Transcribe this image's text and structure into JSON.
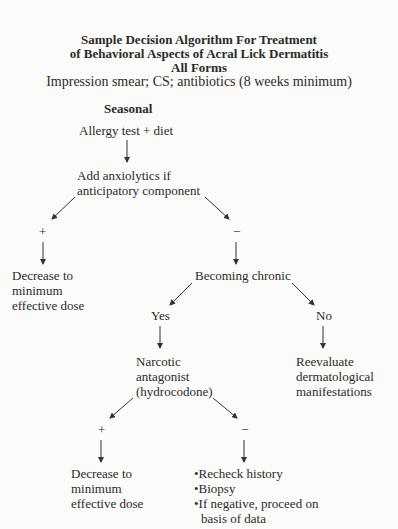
{
  "title": {
    "line1": "Sample Decision Algorithm For Treatment",
    "line2": "of Behavioral Aspects of Acral Lick Dermatitis",
    "line3": "All Forms",
    "subtitle": "Impression smear; CS; antibiotics (8 weeks minimum)"
  },
  "nodes": {
    "seasonal": "Seasonal",
    "allergy": "Allergy test + diet",
    "anxio1": "Add anxiolytics if",
    "anxio2": "anticipatory component",
    "plus1": "+",
    "minus1": "−",
    "dec1_1": "Decrease to",
    "dec1_2": "minimum",
    "dec1_3": "effective dose",
    "chronic": "Becoming chronic",
    "yes": "Yes",
    "no": "No",
    "narc1": "Narcotic",
    "narc2": "antagonist",
    "narc3": "(hydrocodone)",
    "reeval1": "Reevaluate",
    "reeval2": "dermatological",
    "reeval3": "manifestations",
    "plus2": "+",
    "minus2": "−",
    "dec2_1": "Decrease to",
    "dec2_2": "minimum",
    "dec2_3": "effective dose",
    "bullets": [
      "•Recheck history",
      "•Biopsy",
      "•If negative, proceed on",
      "basis of data"
    ]
  }
}
